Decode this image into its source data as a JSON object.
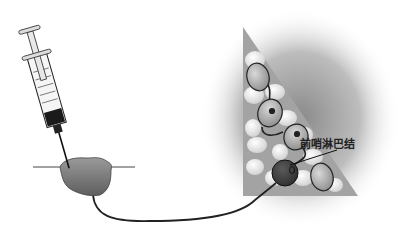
{
  "diagram": {
    "title": "",
    "labels": {
      "sentinel_node": "前哨淋巴结"
    },
    "components": [
      "syringe",
      "tumor-injection-site",
      "skin-line",
      "lymphatic-vessel",
      "lymph-node-basin",
      "lymph-nodes",
      "sentinel-lymph-node"
    ],
    "colors": {
      "tumor": "#7a7a7a",
      "basin_triangle": "#9e9e9e",
      "node_light": "#e6e6e6",
      "node_mid": "#b8b8b8",
      "sentinel_node": "#4a4a4a",
      "vessel": "#222222"
    }
  }
}
